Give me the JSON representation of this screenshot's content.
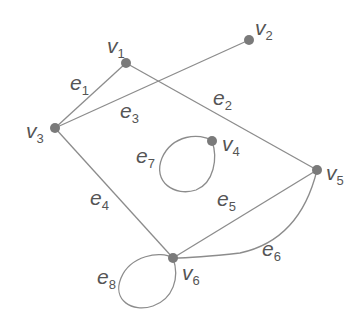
{
  "colors": {
    "edge": "#8c8c8c",
    "vertex": "#7a7a7a",
    "label": "#555555",
    "background": "#ffffff"
  },
  "vertices": [
    {
      "id": "v1",
      "name": "v",
      "sub": "1",
      "x": 126,
      "y": 63,
      "lx": 107,
      "ly": 53
    },
    {
      "id": "v2",
      "name": "v",
      "sub": "2",
      "x": 249,
      "y": 40,
      "lx": 255,
      "ly": 35
    },
    {
      "id": "v3",
      "name": "v",
      "sub": "3",
      "x": 55,
      "y": 128,
      "lx": 26,
      "ly": 138
    },
    {
      "id": "v4",
      "name": "v",
      "sub": "4",
      "x": 212,
      "y": 141,
      "lx": 222,
      "ly": 151
    },
    {
      "id": "v5",
      "name": "v",
      "sub": "5",
      "x": 317,
      "y": 170,
      "lx": 326,
      "ly": 180
    },
    {
      "id": "v6",
      "name": "v",
      "sub": "6",
      "x": 173,
      "y": 258,
      "lx": 182,
      "ly": 280
    }
  ],
  "edges": [
    {
      "id": "e1",
      "name": "e",
      "sub": "1",
      "from": "v3",
      "to": "v1",
      "lx": 70,
      "ly": 90
    },
    {
      "id": "e2",
      "name": "e",
      "sub": "2",
      "from": "v1",
      "to": "v5",
      "lx": 213,
      "ly": 105
    },
    {
      "id": "e3",
      "name": "e",
      "sub": "3",
      "from": "v3",
      "to": "v2",
      "lx": 120,
      "ly": 118
    },
    {
      "id": "e4",
      "name": "e",
      "sub": "4",
      "from": "v3",
      "to": "v6",
      "lx": 90,
      "ly": 205
    },
    {
      "id": "e5",
      "name": "e",
      "sub": "5",
      "from": "v6",
      "to": "v5",
      "lx": 217,
      "ly": 206
    },
    {
      "id": "e6",
      "name": "e",
      "sub": "6",
      "from": "v6",
      "to": "v5",
      "curved": true,
      "lx": 262,
      "ly": 256
    },
    {
      "id": "e7",
      "name": "e",
      "sub": "7",
      "from": "v4",
      "to": "v4",
      "loop": true,
      "lx": 136,
      "ly": 163
    },
    {
      "id": "e8",
      "name": "e",
      "sub": "8",
      "from": "v6",
      "to": "v6",
      "loop": true,
      "lx": 97,
      "ly": 284
    }
  ]
}
